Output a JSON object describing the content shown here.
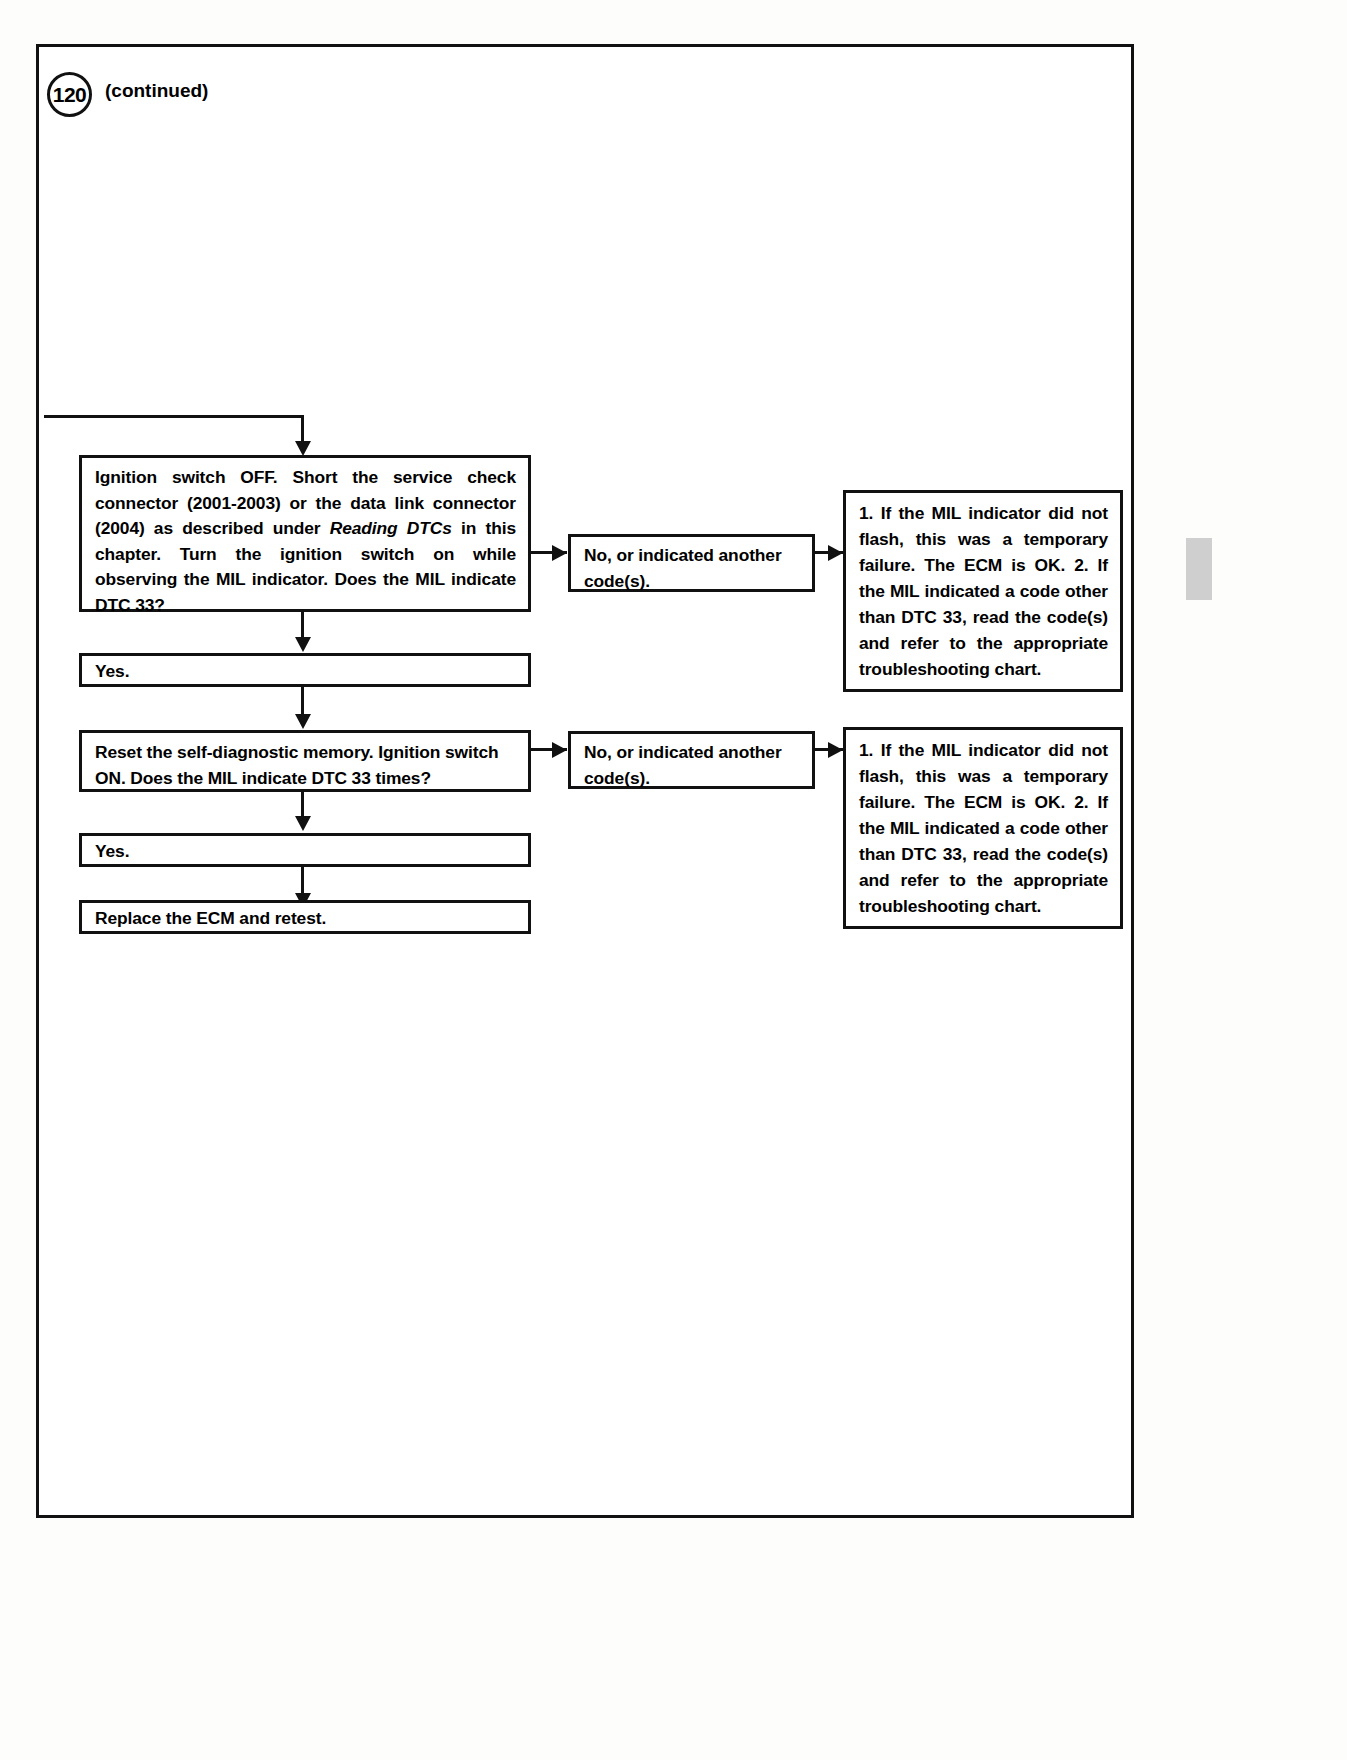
{
  "page": {
    "number": "120",
    "continued_label": "(continued)"
  },
  "flow": {
    "step1_question": {
      "line1": "Ignition switch OFF. Short the service check",
      "line2": "connector (2001-2003) or the data link connector",
      "line3_pre": "(2004) as described under ",
      "line3_italic": "Reading DTCs",
      "line3_post": " in this",
      "line4": "chapter. Turn the ignition switch on while",
      "line5": "observing the MIL indicator. Does the MIL",
      "line6": "indicate DTC 33?"
    },
    "step1_no": "No, or indicated another code(s).",
    "step1_result": {
      "item1": "1. If the MIL indicator did not flash, this was a temporary failure. The ECM is OK.",
      "item2": "2. If the MIL indicated a code other than DTC 33, read the code(s) and refer to the appropriate troubleshooting chart."
    },
    "step1_yes": "Yes.",
    "step2_question": {
      "line1": "Reset the self-diagnostic memory. Ignition switch",
      "line2": "ON. Does the MIL indicate DTC 33 times?"
    },
    "step2_no": "No, or indicated another code(s).",
    "step2_result": {
      "item1": "1. If the MIL indicator did not flash, this was a temporary failure. The ECM is OK.",
      "item2": "2. If the MIL indicated a code other than DTC 33, read the code(s) and refer to the appropriate troubleshooting chart."
    },
    "step2_yes": "Yes.",
    "final_action": "Replace the ECM and retest."
  },
  "colors": {
    "ink": "#111111",
    "paper": "#ffffff",
    "edge_tab": "#cfcfcf"
  }
}
